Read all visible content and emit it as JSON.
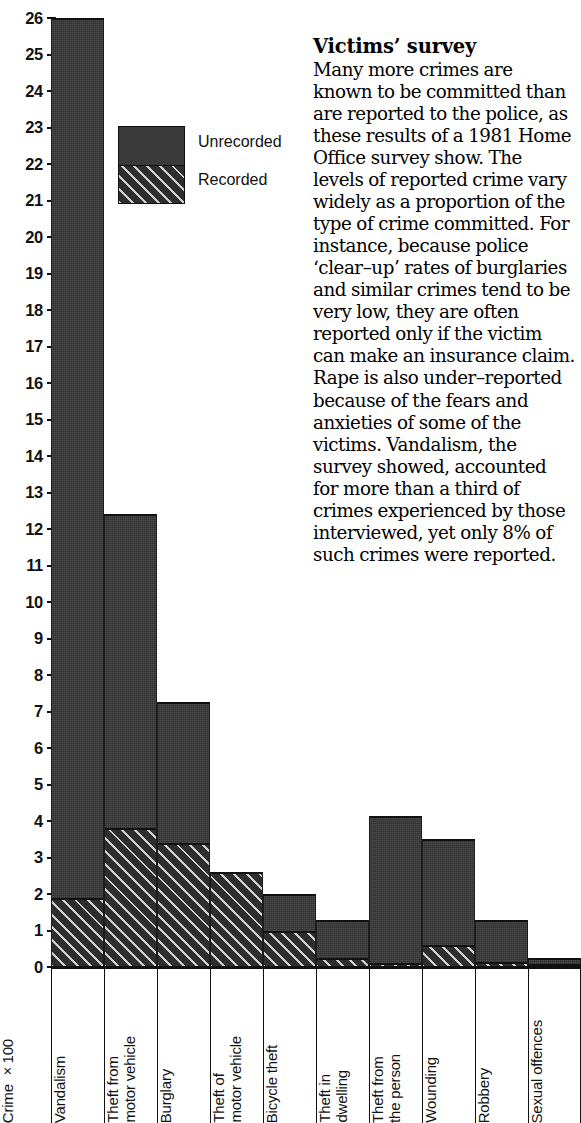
{
  "chart_data": {
    "type": "bar",
    "subtype": "stacked",
    "title": "",
    "xlabel": "",
    "ylabel": "Crime ×100",
    "ylim": [
      0,
      26
    ],
    "ytick_labels": [
      "26",
      "25",
      "24",
      "23",
      "22",
      "21",
      "20",
      "19",
      "18",
      "17",
      "16",
      "15",
      "14",
      "13",
      "12",
      "11",
      "10",
      "9",
      "8",
      "7",
      "6",
      "5",
      "4",
      "3",
      "2",
      "1",
      "0"
    ],
    "grid": false,
    "legend_position": "inside-upper-left",
    "categories": [
      "Vandalism",
      "Theft from\nmotor vehicle",
      "Burglary",
      "Theft of\nmotor vehicle",
      "Bicycle theft",
      "Theft in\ndwelling",
      "Theft from\nthe person",
      "Wounding",
      "Robbery",
      "Sexual offences"
    ],
    "series": [
      {
        "name": "Recorded",
        "fill": "hatched",
        "values": [
          1.9,
          3.8,
          3.4,
          2.6,
          1.0,
          0.25,
          0.1,
          0.6,
          0.15,
          0.05
        ]
      },
      {
        "name": "Unrecorded",
        "fill": "solid",
        "values": [
          24.1,
          8.6,
          3.85,
          0.0,
          1.0,
          1.05,
          4.05,
          2.9,
          1.15,
          0.2
        ]
      }
    ],
    "totals": [
      26.0,
      12.4,
      7.25,
      2.6,
      2.0,
      1.3,
      4.15,
      3.5,
      1.3,
      0.25
    ],
    "colors": {
      "bar_solid": "#3a3a3a",
      "bar_hatch_line": "#cfcfcf",
      "outline": "#111111",
      "background": "#ffffff"
    }
  },
  "legend": {
    "items": [
      {
        "label": "Unrecorded",
        "fill": "solid"
      },
      {
        "label": "Recorded",
        "fill": "hatched"
      }
    ]
  },
  "axis": {
    "y_caption": "Crime ×100"
  },
  "article": {
    "heading": "Victims’ survey",
    "body": "Many more crimes are known to be committed than are reported to the police, as these results of a 1981 Home Office survey show. The levels of reported crime vary widely as a proportion of the type of crime committed. For instance, because police ‘clear–up’ rates of burglaries and similar crimes tend to be very low, they are often reported only if the victim can make an insurance claim. Rape is also under–reported because of the fears and anxieties of some of the victims. Vandalism, the survey showed, accounted for more than a third of crimes experienced by those interviewed, yet only 8% of such crimes were reported."
  }
}
